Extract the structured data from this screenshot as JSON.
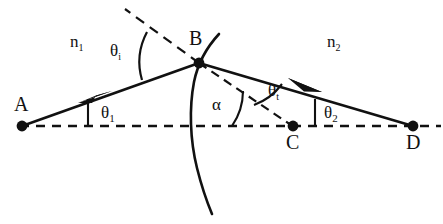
{
  "figure": {
    "type": "optics-ray-diagram",
    "background_color": "#ffffff",
    "stroke_color": "#111111"
  },
  "points": [
    {
      "id": "A",
      "label": "A",
      "description": "object point on optical axis, left side",
      "x": 22,
      "y": 126,
      "label_x": 14,
      "label_y": 94
    },
    {
      "id": "B",
      "label": "B",
      "description": "point of incidence on curved interface",
      "x": 199,
      "y": 63,
      "label_x": 189,
      "label_y": 28
    },
    {
      "id": "C",
      "label": "C",
      "description": "centre of curvature on optical axis",
      "x": 293,
      "y": 126,
      "label_x": 286,
      "label_y": 132
    },
    {
      "id": "D",
      "label": "D",
      "description": "image point on optical axis, right side",
      "x": 413,
      "y": 126,
      "label_x": 406,
      "label_y": 132
    }
  ],
  "media": [
    {
      "id": "n1",
      "label": "n",
      "subscript": "1",
      "description": "refractive index of first medium (left of interface)",
      "x": 70,
      "y": 33
    },
    {
      "id": "n2",
      "label": "n",
      "subscript": "2",
      "description": "refractive index of second medium (right of interface)",
      "x": 327,
      "y": 33
    }
  ],
  "angles": [
    {
      "id": "theta_i",
      "label": "θ",
      "subscript": "i",
      "description": "angle of incidence between incident ray AB and the normal at B",
      "x": 110,
      "y": 42
    },
    {
      "id": "theta_t",
      "label": "θ",
      "subscript": "t",
      "description": "angle of refraction between refracted ray BD and the normal at B",
      "x": 268,
      "y": 82
    },
    {
      "id": "theta_1",
      "label": "θ",
      "subscript": "1",
      "description": "angle between incident ray AB and the optical axis at A",
      "x": 101,
      "y": 104
    },
    {
      "id": "theta_2",
      "label": "θ",
      "subscript": "2",
      "description": "angle between refracted ray BD and the optical axis at D",
      "x": 324,
      "y": 104
    },
    {
      "id": "alpha",
      "label": "α",
      "subscript": "",
      "description": "angle between the normal BC and the optical axis at C",
      "x": 212,
      "y": 96
    }
  ],
  "rays": [
    {
      "id": "incident-ray",
      "label": "A to B",
      "style": "solid",
      "arrow": true
    },
    {
      "id": "refracted-ray",
      "label": "B to D",
      "style": "solid",
      "arrow": true
    },
    {
      "id": "normal-line",
      "label": "normal through B to C",
      "style": "dashed",
      "arrow": false
    },
    {
      "id": "optical-axis",
      "label": "A to D horizontal axis",
      "style": "dashed",
      "arrow": false
    },
    {
      "id": "interface-arc",
      "label": "curved refracting surface",
      "style": "solid",
      "arrow": false
    }
  ]
}
